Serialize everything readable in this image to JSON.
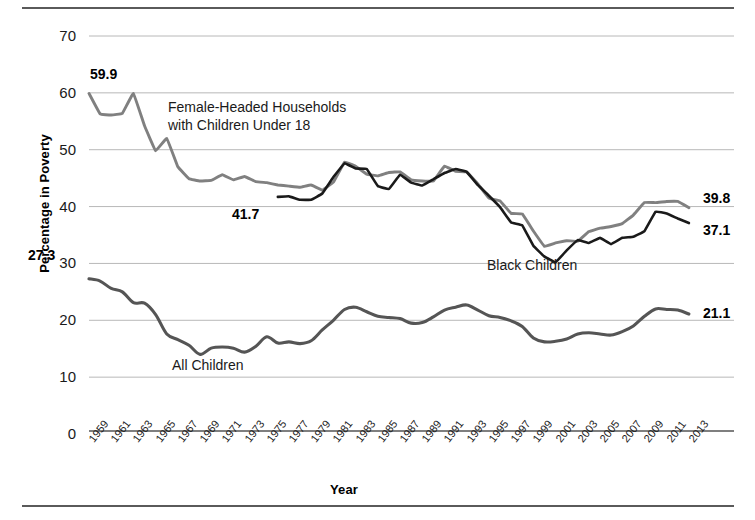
{
  "figure": {
    "ylabel": "Percentage in Poverty",
    "xlabel": "Year"
  },
  "labels": {
    "female_headed": "Female-Headed Households\nwith Children Under 18",
    "female_headed_line1": "Female-Headed Households",
    "female_headed_line2": "with Children Under 18",
    "black_children": "Black Children",
    "all_children": "All Children"
  },
  "callouts": {
    "fhh_start": "59.9",
    "black_start": "41.7",
    "all_start": "27.3",
    "fhh_end": "39.8",
    "black_end": "37.1",
    "all_end": "21.1"
  },
  "colors": {
    "female_headed": "#808080",
    "black_children": "#1a1a1a",
    "all_children": "#555555",
    "gridline": "#b8b8b8",
    "axis": "#555555",
    "rule": "#5a5a5a"
  },
  "chart_data": {
    "type": "line",
    "title": "",
    "xlabel": "Year",
    "ylabel": "Percentage in Poverty",
    "xlim": [
      1959,
      2014
    ],
    "ylim": [
      0,
      70
    ],
    "yticks": [
      0,
      10,
      20,
      30,
      40,
      50,
      60,
      70
    ],
    "xticks": [
      1959,
      1961,
      1963,
      1965,
      1967,
      1969,
      1971,
      1973,
      1975,
      1977,
      1979,
      1981,
      1983,
      1985,
      1987,
      1989,
      1991,
      1993,
      1995,
      1997,
      1999,
      2001,
      2003,
      2005,
      2007,
      2009,
      2011,
      2013
    ],
    "grid": "horizontal",
    "legend": "inline-annotations",
    "series": [
      {
        "name": "Female-Headed Households with Children Under 18",
        "color": "#808080",
        "x": [
          1959,
          1960,
          1961,
          1962,
          1963,
          1964,
          1965,
          1966,
          1967,
          1968,
          1969,
          1970,
          1971,
          1972,
          1973,
          1974,
          1975,
          1976,
          1977,
          1978,
          1979,
          1980,
          1981,
          1982,
          1983,
          1984,
          1985,
          1986,
          1987,
          1988,
          1989,
          1990,
          1991,
          1992,
          1993,
          1994,
          1995,
          1996,
          1997,
          1998,
          1999,
          2000,
          2001,
          2002,
          2003,
          2004,
          2005,
          2006,
          2007,
          2008,
          2009,
          2010,
          2011,
          2012,
          2013
        ],
        "values": [
          59.9,
          56.3,
          56.1,
          56.4,
          59.9,
          54.2,
          49.8,
          52.0,
          47.0,
          44.9,
          44.5,
          44.6,
          45.6,
          44.7,
          45.3,
          44.4,
          44.2,
          43.8,
          43.6,
          43.4,
          43.8,
          42.9,
          44.3,
          47.8,
          47.1,
          45.7,
          45.4,
          46.0,
          46.1,
          44.7,
          44.5,
          44.5,
          47.1,
          46.2,
          46.1,
          44.0,
          41.5,
          41.0,
          38.8,
          38.7,
          35.7,
          33.0,
          33.6,
          34.0,
          33.9,
          35.6,
          36.2,
          36.5,
          37.0,
          38.5,
          40.7,
          40.7,
          40.9,
          40.9,
          39.8
        ]
      },
      {
        "name": "Black Children",
        "color": "#1a1a1a",
        "x": [
          1976,
          1977,
          1978,
          1979,
          1980,
          1981,
          1982,
          1983,
          1984,
          1985,
          1986,
          1987,
          1988,
          1989,
          1990,
          1991,
          1992,
          1993,
          1994,
          1995,
          1996,
          1997,
          1998,
          1999,
          2000,
          2001,
          2002,
          2003,
          2004,
          2005,
          2006,
          2007,
          2008,
          2009,
          2010,
          2011,
          2012,
          2013
        ],
        "values": [
          41.7,
          41.8,
          41.2,
          41.2,
          42.3,
          45.2,
          47.6,
          46.7,
          46.6,
          43.6,
          43.1,
          45.6,
          44.2,
          43.7,
          44.8,
          45.9,
          46.6,
          46.1,
          43.8,
          41.9,
          39.9,
          37.2,
          36.7,
          33.1,
          31.2,
          30.2,
          32.3,
          34.1,
          33.6,
          34.5,
          33.4,
          34.5,
          34.7,
          35.7,
          39.1,
          38.8,
          37.9,
          37.1
        ]
      },
      {
        "name": "All Children",
        "color": "#555555",
        "x": [
          1959,
          1960,
          1961,
          1962,
          1963,
          1964,
          1965,
          1966,
          1967,
          1968,
          1969,
          1970,
          1971,
          1972,
          1973,
          1974,
          1975,
          1976,
          1977,
          1978,
          1979,
          1980,
          1981,
          1982,
          1983,
          1984,
          1985,
          1986,
          1987,
          1988,
          1989,
          1990,
          1991,
          1992,
          1993,
          1994,
          1995,
          1996,
          1997,
          1998,
          1999,
          2000,
          2001,
          2002,
          2003,
          2004,
          2005,
          2006,
          2007,
          2008,
          2009,
          2010,
          2011,
          2012,
          2013
        ],
        "values": [
          27.3,
          26.9,
          25.6,
          25.0,
          23.1,
          23.0,
          21.0,
          17.6,
          16.6,
          15.6,
          14.0,
          15.1,
          15.3,
          15.1,
          14.4,
          15.4,
          17.1,
          16.0,
          16.2,
          15.9,
          16.4,
          18.3,
          20.0,
          21.9,
          22.3,
          21.5,
          20.7,
          20.5,
          20.3,
          19.5,
          19.6,
          20.6,
          21.8,
          22.3,
          22.7,
          21.8,
          20.8,
          20.5,
          19.9,
          18.9,
          16.9,
          16.2,
          16.3,
          16.7,
          17.6,
          17.8,
          17.6,
          17.4,
          18.0,
          19.0,
          20.7,
          22.0,
          21.9,
          21.8,
          21.1
        ]
      }
    ]
  }
}
